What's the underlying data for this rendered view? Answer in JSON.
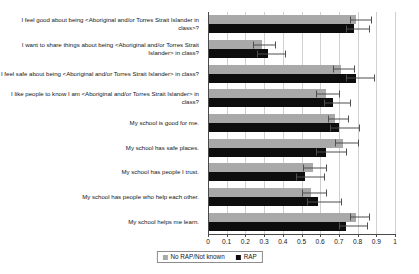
{
  "chart_data": {
    "type": "bar",
    "orientation": "horizontal",
    "title": "",
    "subtitle": "",
    "xlabel": "",
    "ylabel": "",
    "xlim": [
      0,
      1
    ],
    "xticks": [
      "0",
      "0.1",
      "0.2",
      "0.3",
      "0.4",
      "0.5",
      "0.6",
      "0.7",
      "0.8",
      "0.9",
      "1"
    ],
    "xtick_values": [
      0,
      0.1,
      0.2,
      0.3,
      0.4,
      0.5,
      0.6,
      0.7,
      0.8,
      0.9,
      1
    ],
    "grid": true,
    "grid_axis": "x",
    "legend_position": "bottom",
    "error_bars": true,
    "categories": [
      "I feel good about being <Aboriginal and/or Torres Strait Islander in class>?",
      "I want to share things about being <Aboriginal and/or Torres Strait Islander> in class?",
      "I feel safe about being <Aboriginal and/or Torres Strait Islander> in class?",
      "I like people to know I am <Aboriginal and/or Torres Strait Islander> in class?",
      "My school is good for me.",
      "My school has safe places.",
      "My school has people I trust.",
      "My school has people who help each other.",
      "My school helps me learn."
    ],
    "series": [
      {
        "name": "No RAP/Not known",
        "color": "#a9a9a9",
        "values": [
          0.79,
          0.29,
          0.71,
          0.63,
          0.68,
          0.72,
          0.56,
          0.55,
          0.79
        ],
        "err_low": [
          0.76,
          0.24,
          0.67,
          0.58,
          0.64,
          0.68,
          0.51,
          0.5,
          0.76
        ],
        "err_high": [
          0.87,
          0.36,
          0.78,
          0.7,
          0.75,
          0.8,
          0.63,
          0.63,
          0.86
        ]
      },
      {
        "name": "RAP",
        "color": "#0d0d0d",
        "values": [
          0.78,
          0.32,
          0.79,
          0.67,
          0.7,
          0.63,
          0.52,
          0.59,
          0.74
        ],
        "err_low": [
          0.74,
          0.26,
          0.74,
          0.62,
          0.65,
          0.58,
          0.47,
          0.53,
          0.7
        ],
        "err_high": [
          0.86,
          0.41,
          0.89,
          0.76,
          0.81,
          0.74,
          0.62,
          0.71,
          0.85
        ]
      }
    ]
  },
  "legend": {
    "items": [
      {
        "label": "No RAP/Not known",
        "color": "#a9a9a9"
      },
      {
        "label": "RAP",
        "color": "#0d0d0d"
      }
    ]
  }
}
